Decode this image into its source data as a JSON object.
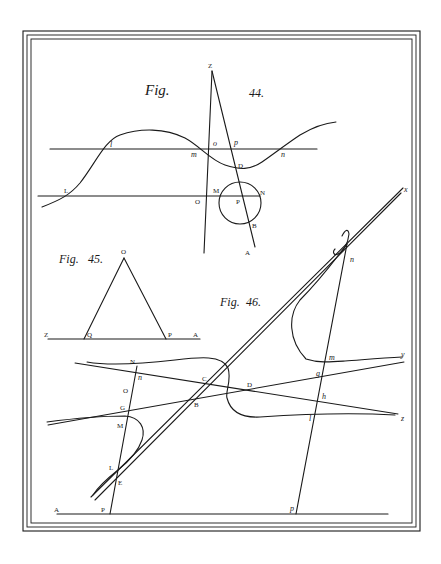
{
  "plate": {
    "figures": [
      {
        "id": "fig44",
        "caption_word": "Fig.",
        "caption_number": "44.",
        "labels": {
          "Z": "Z",
          "l": "l",
          "o": "o",
          "p": "p",
          "m": "m",
          "n": "n",
          "D": "D",
          "L": "L",
          "M": "M",
          "N": "N",
          "O": "O",
          "P": "P",
          "B": "B",
          "A": "A"
        }
      },
      {
        "id": "fig45",
        "caption_word": "Fig.",
        "caption_number": "45.",
        "labels": {
          "O": "O",
          "Z": "Z",
          "Q": "Q",
          "P": "P",
          "A": "A"
        }
      },
      {
        "id": "fig46",
        "caption_word": "Fig.",
        "caption_number": "46.",
        "labels": {
          "x": "x",
          "f": "f",
          "n_upper": "n",
          "m": "m",
          "y": "y",
          "g": "g",
          "h": "h",
          "l": "l",
          "z": "z",
          "N": "N",
          "n_lower": "n",
          "C": "C",
          "D": "D",
          "O": "O",
          "G": "G",
          "B": "B",
          "M": "M",
          "L": "L",
          "E": "E",
          "A": "A",
          "P": "P",
          "p": "p"
        }
      }
    ]
  }
}
